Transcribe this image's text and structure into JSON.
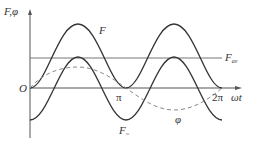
{
  "diagram": {
    "title": "",
    "axes": {
      "y_label": "F,φ",
      "x_label": "ωt",
      "origin_label": "O",
      "x_ticks": [
        "π",
        "2π"
      ]
    },
    "curves": [
      {
        "name": "F",
        "label": "F",
        "style": "solid",
        "description": "Total force: rectified-cosine shape, minimum 0 at 0, π, 2π; maxima at π/2 and 3π/2"
      },
      {
        "name": "F_~",
        "label": "F",
        "label_sub": "~",
        "style": "solid",
        "description": "Alternating component: oscillates about F_av with period π"
      },
      {
        "name": "φ",
        "label": "φ",
        "style": "dashed",
        "description": "Flux: sinusoid with period 2π, zero at 0, π, 2π"
      }
    ],
    "reference_line": {
      "label": "F",
      "label_sub": "av",
      "style": "solid",
      "description": "Average force level"
    },
    "colors": {
      "line": "#333333",
      "dashed": "#888888",
      "axis": "#555555",
      "background": "#ffffff"
    }
  }
}
